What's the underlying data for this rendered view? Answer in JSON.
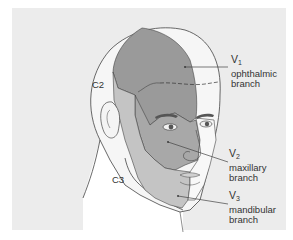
{
  "figure": {
    "background_color": "#ececec",
    "colors": {
      "v1": "#9a9a9a",
      "v2": "#a8a8a8",
      "v3": "#c4c4c4",
      "cervical": "#f4f4f4",
      "outline": "#444444"
    },
    "labels": {
      "v1": {
        "symbol": "V",
        "subscript": "1",
        "line1": "ophthalmic",
        "line2": "branch"
      },
      "v2": {
        "symbol": "V",
        "subscript": "2",
        "line1": "maxillary",
        "line2": "branch"
      },
      "v3": {
        "symbol": "V",
        "subscript": "3",
        "line1": "mandibular",
        "line2": "branch"
      },
      "c2": "C2",
      "c3": "C3"
    }
  }
}
